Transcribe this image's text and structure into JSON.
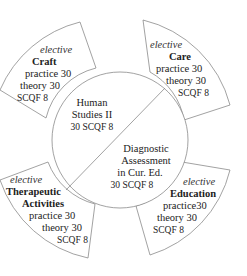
{
  "center": {
    "upper": {
      "lines": [
        "Human",
        "Studies II",
        "30 SCQF 8"
      ]
    },
    "lower": {
      "lines": [
        "Diagnostic",
        "Assessment",
        "in Cur. Ed.",
        "30 SCQF 8"
      ]
    }
  },
  "segments": [
    {
      "name": "craft",
      "tag": "elective",
      "title": "Craft",
      "practice": "practice 30",
      "theory": "theory 30",
      "scqf": "SCQF 8"
    },
    {
      "name": "care",
      "tag": "elective",
      "title": "Care",
      "practice": "practice 30",
      "theory": "theory 30",
      "scqf": "SCQF 8"
    },
    {
      "name": "education",
      "tag": "elective",
      "title": "Education",
      "practice": "practice30",
      "theory": "theory 30",
      "scqf": "SCQF 8"
    },
    {
      "name": "therapeutic",
      "tag": "elective",
      "title1": "Therapeutic",
      "title2": "Activities",
      "practice": "practice 30",
      "theory": "theory 30",
      "scqf": "SCQF 8"
    }
  ]
}
